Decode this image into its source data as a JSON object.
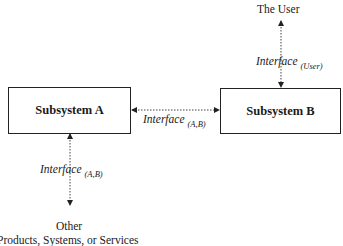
{
  "diagram": {
    "nodes": {
      "subsystem_a": {
        "label": "Subsystem A"
      },
      "subsystem_b": {
        "label": "Subsystem B"
      },
      "user": {
        "label": "The User"
      },
      "other": {
        "label": "Other",
        "sublabel": "Products, Systems, or Services"
      }
    },
    "edges": {
      "a_b": {
        "label": "Interface",
        "subscript": "(A,B)",
        "style": "dotted",
        "arrows": "both"
      },
      "b_user": {
        "label": "Interface",
        "subscript": "(User)",
        "style": "dotted",
        "arrows": "both"
      },
      "a_other": {
        "label": "Interface",
        "subscript": "(A,B)",
        "style": "dotted",
        "arrows": "both"
      }
    }
  }
}
